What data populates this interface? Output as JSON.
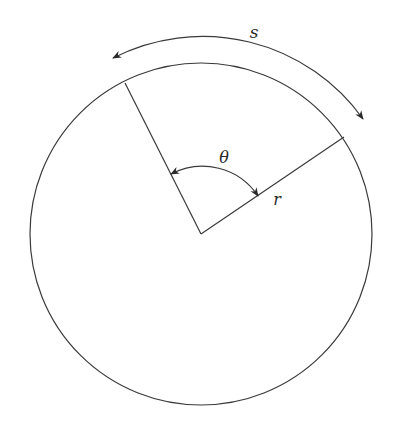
{
  "diagram": {
    "type": "circle-arc-length",
    "colors": {
      "line": "#3a3a3a",
      "text": "#2a2a2a",
      "background": "#ffffff"
    },
    "circle": {
      "cx": 201,
      "cy": 234,
      "r": 171
    },
    "radius_left_end": {
      "x": 125,
      "y": 83
    },
    "radius_right_end": {
      "x": 344,
      "y": 137
    },
    "outer_arc": {
      "r": 197,
      "start": {
        "x": 113,
        "y": 58
      },
      "end": {
        "x": 363,
        "y": 119
      },
      "arrows": "both"
    },
    "angle_arc": {
      "r": 67,
      "start": {
        "x": 171,
        "y": 174
      },
      "end": {
        "x": 257,
        "y": 196
      },
      "arrows": "both"
    },
    "labels": {
      "arc_length": "s",
      "angle": "θ",
      "radius": "r"
    }
  }
}
